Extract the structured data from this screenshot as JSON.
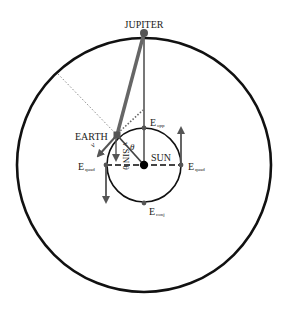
{
  "diagram": {
    "labels": {
      "jupiter": "JUPITER",
      "earth": "EARTH",
      "sun": "SUN",
      "e_opp_main": "E",
      "e_opp_sub": "opp",
      "e_quad_left_main": "E",
      "e_quad_left_sub": "quad",
      "e_quad_right_main": "E",
      "e_quad_right_sub": "quad",
      "e_conj_main": "E",
      "e_conj_sub": "conj",
      "theta": "θ",
      "v": "v",
      "v_sin_theta": "v SIN θ"
    },
    "colors": {
      "orbit": "#111111",
      "line_gray": "#666666",
      "sun": "#000000",
      "dotted": "#888888"
    }
  }
}
